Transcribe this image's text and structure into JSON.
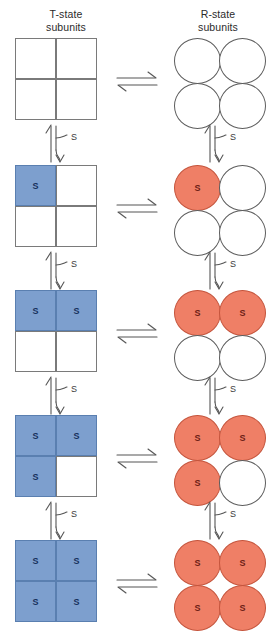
{
  "headers": {
    "left": "T-state\nsubunits",
    "right": "R-state\nsubunits"
  },
  "labels": {
    "substrate": "S"
  },
  "colors": {
    "t_state_fill": "#7d9fce",
    "t_state_stroke": "#5a7fb0",
    "t_state_text": "#17315c",
    "r_state_fill": "#ef7f66",
    "r_state_stroke": "#c4543c",
    "r_state_text": "#6d2116",
    "empty_fill": "#ffffff",
    "outline": "#7a7a7a",
    "arrow": "#555555",
    "background": "#ffffff"
  },
  "diagram": {
    "type": "equilibrium-ladder",
    "subunit_order": [
      "top-left",
      "top-right",
      "bottom-left",
      "bottom-right"
    ],
    "rows": [
      {
        "id": "row-0",
        "bound_count": 0,
        "t_state": {
          "shape": "square",
          "occupancy": [
            false,
            false,
            false,
            false
          ],
          "labels": [
            "",
            "",
            "",
            ""
          ]
        },
        "r_state": {
          "shape": "circle",
          "occupancy": [
            false,
            false,
            false,
            false
          ],
          "labels": [
            "",
            "",
            "",
            ""
          ]
        }
      },
      {
        "id": "row-1",
        "bound_count": 1,
        "t_state": {
          "shape": "square",
          "occupancy": [
            true,
            false,
            false,
            false
          ],
          "labels": [
            "S",
            "",
            "",
            ""
          ]
        },
        "r_state": {
          "shape": "circle",
          "occupancy": [
            true,
            false,
            false,
            false
          ],
          "labels": [
            "S",
            "",
            "",
            ""
          ]
        }
      },
      {
        "id": "row-2",
        "bound_count": 2,
        "t_state": {
          "shape": "square",
          "occupancy": [
            true,
            true,
            false,
            false
          ],
          "labels": [
            "S",
            "S",
            "",
            ""
          ]
        },
        "r_state": {
          "shape": "circle",
          "occupancy": [
            true,
            true,
            false,
            false
          ],
          "labels": [
            "S",
            "S",
            "",
            ""
          ]
        }
      },
      {
        "id": "row-3",
        "bound_count": 3,
        "t_state": {
          "shape": "square",
          "occupancy": [
            true,
            true,
            true,
            false
          ],
          "labels": [
            "S",
            "S",
            "S",
            ""
          ]
        },
        "r_state": {
          "shape": "circle",
          "occupancy": [
            true,
            true,
            true,
            false
          ],
          "labels": [
            "S",
            "S",
            "S",
            ""
          ]
        }
      },
      {
        "id": "row-4",
        "bound_count": 4,
        "t_state": {
          "shape": "square",
          "occupancy": [
            true,
            true,
            true,
            true
          ],
          "labels": [
            "S",
            "S",
            "S",
            "S"
          ]
        },
        "r_state": {
          "shape": "circle",
          "occupancy": [
            true,
            true,
            true,
            true
          ],
          "labels": [
            "S",
            "S",
            "S",
            "S"
          ]
        }
      }
    ],
    "horizontal_arrows": {
      "count": 5,
      "glyph": "equilibrium",
      "label": ""
    },
    "vertical_arrows": {
      "count": 8,
      "glyph": "equilibrium-with-branch",
      "label": "S",
      "note": "four between rows in the left column, four between rows in the right column"
    }
  }
}
